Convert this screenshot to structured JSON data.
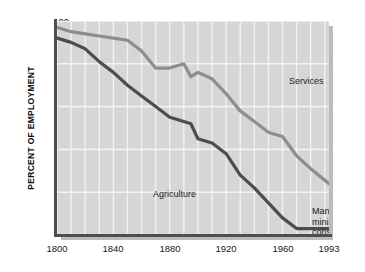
{
  "chart_data": {
    "type": "area",
    "title": "",
    "subtitle": "",
    "xlabel": "",
    "ylabel": "PERCENT OF EMPLOYMENT",
    "xlim": [
      1800,
      1993
    ],
    "ylim": [
      0,
      100
    ],
    "grid": true,
    "grid_x_step": 10,
    "grid_y_step": 20,
    "legend_position": "in-plot annotations",
    "x_tick_labels": [
      "1800",
      "1840",
      "1880",
      "1920",
      "1960",
      "1993"
    ],
    "x_tick_values": [
      1800,
      1840,
      1880,
      1920,
      1960,
      1993
    ],
    "y_tick_labels": [
      "0",
      "20",
      "40",
      "60",
      "80",
      "100"
    ],
    "y_tick_values": [
      0,
      20,
      40,
      60,
      80,
      100
    ],
    "annotations": [
      {
        "name": "services",
        "text": "Services"
      },
      {
        "name": "agriculture",
        "text": "Agriculture"
      },
      {
        "name": "manufacturing",
        "text": "Manufacturing,\nmining, and\nconstruction"
      }
    ],
    "series": [
      {
        "name": "Agriculture + Manufacturing boundary (upper, Services below-line)",
        "label": "Services",
        "color": "#8d8d8d",
        "x": [
          1800,
          1810,
          1820,
          1830,
          1840,
          1850,
          1860,
          1870,
          1880,
          1890,
          1895,
          1900,
          1910,
          1920,
          1930,
          1940,
          1950,
          1955,
          1960,
          1970,
          1980,
          1993
        ],
        "values": [
          97,
          95,
          94,
          93,
          92,
          91,
          86,
          78,
          78,
          80,
          74,
          76,
          73,
          66,
          58,
          53,
          48,
          47,
          46,
          37,
          31,
          24
        ]
      },
      {
        "name": "Agriculture upper boundary",
        "label": "Agriculture",
        "color": "#4c4c4c",
        "x": [
          1800,
          1810,
          1820,
          1830,
          1840,
          1850,
          1860,
          1870,
          1880,
          1890,
          1895,
          1900,
          1910,
          1920,
          1930,
          1940,
          1950,
          1960,
          1970,
          1980,
          1993
        ],
        "values": [
          92,
          90,
          87,
          81,
          76,
          70,
          65,
          60,
          55,
          53,
          52,
          45,
          43,
          38,
          28,
          22,
          15,
          8,
          3,
          3,
          3
        ]
      }
    ],
    "regions": [
      {
        "name": "Services",
        "position": "above upper line"
      },
      {
        "name": "Agriculture",
        "position": "below lower line"
      },
      {
        "name": "Manufacturing, mining, and construction",
        "position": "between the two lines"
      }
    ],
    "colors": {
      "plot_background": "#d6d6d6",
      "gridline": "#f2f2f2",
      "axis": "#4f4f4f",
      "services_line": "#8d8d8d",
      "agriculture_line": "#4c4c4c",
      "page_background": "#ffffff",
      "text": "#1a1a1a"
    }
  }
}
